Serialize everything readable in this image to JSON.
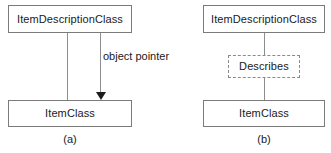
{
  "figure": {
    "background_color": "#ffffff",
    "box_border_color": "#7b7b7b",
    "dashed_border_color": "#8a8a8a",
    "connector_color": "#8d8d8d",
    "arrow_color": "#1c1c1c",
    "text_color": "#1a1a1a"
  },
  "panels": [
    {
      "id": "a",
      "caption": "(a)",
      "nodes": {
        "top": "ItemDescriptionClass",
        "bottom": "ItemClass"
      },
      "edge_label": "object pointer",
      "connectors": [
        {
          "name": "plain-association",
          "style": "solid",
          "arrow": false
        },
        {
          "name": "object-pointer-association",
          "style": "solid",
          "arrow": true,
          "arrow_direction": "down"
        }
      ]
    },
    {
      "id": "b",
      "caption": "(b)",
      "nodes": {
        "top": "ItemDescriptionClass",
        "middle": "Describes",
        "bottom": "ItemClass"
      },
      "middle_node_style": "dashed",
      "connectors": [
        {
          "name": "upper-association",
          "style": "solid",
          "arrow": false
        },
        {
          "name": "lower-association",
          "style": "solid",
          "arrow": false
        }
      ]
    }
  ]
}
